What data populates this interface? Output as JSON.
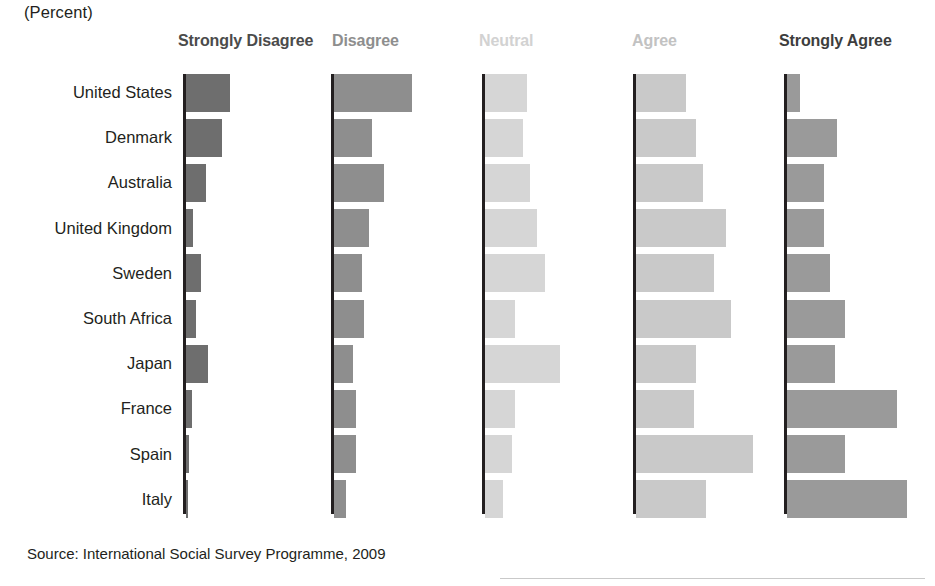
{
  "unit_label": "(Percent)",
  "source": "Source: International Social Survey Programme, 2009",
  "colors": {
    "strongly_disagree": "#6e6e6e",
    "disagree": "#8e8e8e",
    "neutral": "#d6d6d6",
    "agree": "#c9c9c9",
    "strongly_agree": "#9a9a9a",
    "axis": "#231f20",
    "text": "#231f20"
  },
  "chart_data": {
    "type": "bar",
    "title": "",
    "subtitle": "",
    "xlabel": "",
    "ylabel": "",
    "unit": "Percent",
    "orientation": "horizontal",
    "layout": "small-multiples-panels",
    "grid": false,
    "legend": "none",
    "panel_headers": [
      "Strongly Disagree",
      "Disagree",
      "Neutral",
      "Agree",
      "Strongly Agree"
    ],
    "categories": [
      "United States",
      "Denmark",
      "Australia",
      "United Kingdom",
      "Sweden",
      "South Africa",
      "Japan",
      "France",
      "Spain",
      "Italy"
    ],
    "series": [
      {
        "name": "Strongly Disagree",
        "values": [
          22,
          18,
          10,
          3.5,
          7.5,
          5,
          11,
          3,
          1.5,
          1
        ]
      },
      {
        "name": "Disagree",
        "values": [
          39,
          19,
          25,
          17.5,
          14,
          15,
          9.5,
          11,
          11,
          6
        ]
      },
      {
        "name": "Neutral",
        "values": [
          21,
          19,
          22.5,
          26,
          30,
          15,
          37.5,
          15,
          13.5,
          9
        ]
      },
      {
        "name": "Agree",
        "values": [
          25,
          30,
          33.5,
          45,
          39,
          47.5,
          30,
          29,
          58.5,
          35
        ]
      },
      {
        "name": "Strongly Agree",
        "values": [
          6.5,
          25,
          18.5,
          18.5,
          21.5,
          29,
          24,
          55,
          29,
          60
        ]
      }
    ],
    "xlim": [
      0,
      60
    ],
    "ylim": null
  }
}
